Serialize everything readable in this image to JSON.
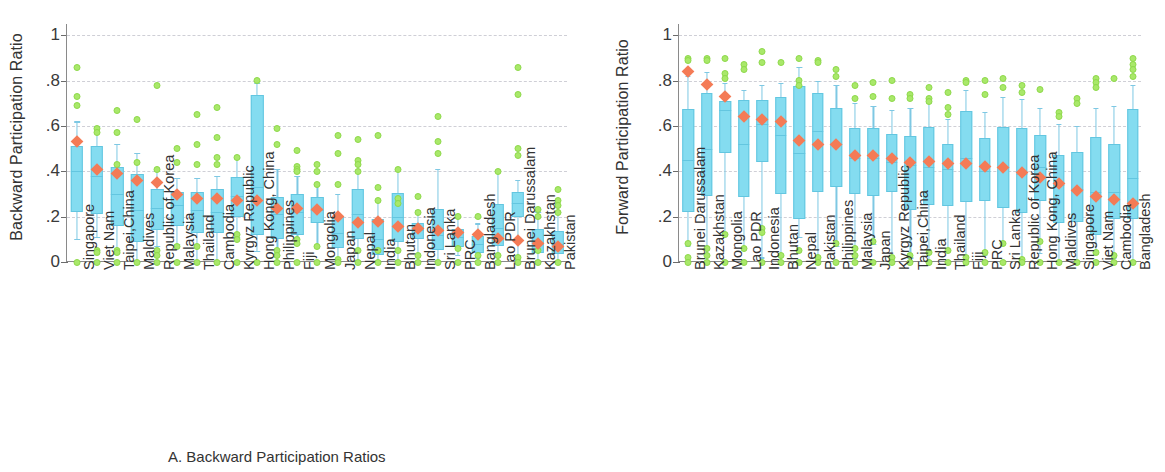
{
  "figure": {
    "panel_a_caption": "A.  Backward Participation Ratios",
    "panel_b_caption": "B.  Forward Participation Ratios"
  },
  "colors": {
    "box_fill": "#84dcf0",
    "box_edge": "#63c6e0",
    "outlier": "#a9e86a",
    "mean_marker": "#f47b56",
    "grid": "#cfcfd6",
    "axis": "#8a8a8a"
  },
  "chart_data": [
    {
      "type": "box",
      "panel": "A",
      "title": "A.  Backward Participation Ratios",
      "xlabel": "",
      "ylabel": "Backward Participation Ratio",
      "ylim": [
        0,
        1.05
      ],
      "yticks": [
        0,
        0.2,
        0.4,
        0.6,
        0.8,
        1
      ],
      "ytick_labels": [
        "0",
        ".2",
        ".4",
        ".6",
        ".8",
        "1"
      ],
      "grid": true,
      "legend": "none",
      "categories": [
        "Singapore",
        "Viet Nam",
        "Taipei,China",
        "Maldives",
        "Republic of Korea",
        "Malaysia",
        "Thailand",
        "Cambodia",
        "Kyrgyz Republic",
        "Hong Kong, China",
        "Philippines",
        "Fiji",
        "Mongolia",
        "Japan",
        "Nepal",
        "India",
        "Bhutan",
        "Indonesia",
        "Sri Lanka",
        "PRC",
        "Bangladesh",
        "Lao PDR",
        "Brunei Darussalam",
        "Kazakhstan",
        "Pakistan"
      ],
      "boxes": [
        {
          "whislo": 0.1,
          "q1": 0.22,
          "med": 0.4,
          "q3": 0.51,
          "whishi": 0.62,
          "mean": 0.53,
          "outliers": [
            0.86,
            0.73,
            0.69,
            0.0
          ]
        },
        {
          "whislo": 0.11,
          "q1": 0.21,
          "med": 0.38,
          "q3": 0.51,
          "whishi": 0.6,
          "mean": 0.41,
          "outliers": [
            0.59,
            0.57,
            0.05,
            0.04,
            0.0
          ]
        },
        {
          "whislo": 0.04,
          "q1": 0.16,
          "med": 0.3,
          "q3": 0.42,
          "whishi": 0.52,
          "mean": 0.39,
          "outliers": [
            0.67,
            0.57,
            0.43,
            0.05,
            0.04,
            0.0
          ]
        },
        {
          "whislo": 0.0,
          "q1": 0.09,
          "med": 0.23,
          "q3": 0.39,
          "whishi": 0.48,
          "mean": 0.36,
          "outliers": [
            0.63,
            0.44,
            0.0
          ]
        },
        {
          "whislo": 0.07,
          "q1": 0.14,
          "med": 0.24,
          "q3": 0.32,
          "whishi": 0.4,
          "mean": 0.35,
          "outliers": [
            0.78,
            0.41,
            0.05,
            0.03,
            0.0
          ]
        },
        {
          "whislo": 0.08,
          "q1": 0.16,
          "med": 0.25,
          "q3": 0.31,
          "whishi": 0.37,
          "mean": 0.3,
          "outliers": [
            0.5,
            0.44,
            0.07,
            0.0
          ]
        },
        {
          "whislo": 0.0,
          "q1": 0.13,
          "med": 0.23,
          "q3": 0.31,
          "whishi": 0.37,
          "mean": 0.28,
          "outliers": [
            0.65,
            0.52,
            0.43,
            0.07,
            0.0
          ]
        },
        {
          "whislo": 0.0,
          "q1": 0.13,
          "med": 0.22,
          "q3": 0.32,
          "whishi": 0.38,
          "mean": 0.28,
          "outliers": [
            0.68,
            0.55,
            0.46,
            0.43,
            0.0
          ]
        },
        {
          "whislo": 0.11,
          "q1": 0.2,
          "med": 0.29,
          "q3": 0.375,
          "whishi": 0.46,
          "mean": 0.27,
          "outliers": [
            0.46,
            0.12,
            0.1,
            0.0
          ]
        },
        {
          "whislo": 0.05,
          "q1": 0.12,
          "med": 0.33,
          "q3": 0.735,
          "whishi": 0.79,
          "mean": 0.27,
          "outliers": [
            0.8,
            0.0
          ]
        },
        {
          "whislo": 0.03,
          "q1": 0.1,
          "med": 0.21,
          "q3": 0.285,
          "whishi": 0.41,
          "mean": 0.235,
          "outliers": [
            0.59,
            0.52,
            0.05,
            0.03,
            0.0
          ]
        },
        {
          "whislo": 0.08,
          "q1": 0.12,
          "med": 0.22,
          "q3": 0.3,
          "whishi": 0.38,
          "mean": 0.235,
          "outliers": [
            0.49,
            0.42,
            0.41,
            0.4,
            0.1,
            0.08,
            0.0
          ]
        },
        {
          "whislo": 0.07,
          "q1": 0.17,
          "med": 0.23,
          "q3": 0.285,
          "whishi": 0.34,
          "mean": 0.23,
          "outliers": [
            0.43,
            0.4,
            0.34,
            0.07,
            0.0
          ]
        },
        {
          "whislo": 0.01,
          "q1": 0.06,
          "med": 0.13,
          "q3": 0.2,
          "whishi": 0.3,
          "mean": 0.2,
          "outliers": [
            0.56,
            0.48,
            0.34,
            0.01,
            0.0
          ]
        },
        {
          "whislo": 0.0,
          "q1": 0.1,
          "med": 0.21,
          "q3": 0.32,
          "whishi": 0.4,
          "mean": 0.175,
          "outliers": [
            0.54,
            0.45,
            0.43,
            0.4,
            0.05,
            0.0
          ]
        },
        {
          "whislo": 0.0,
          "q1": 0.03,
          "med": 0.1,
          "q3": 0.19,
          "whishi": 0.27,
          "mean": 0.18,
          "outliers": [
            0.56,
            0.33,
            0.27,
            0.05,
            0.0
          ]
        },
        {
          "whislo": 0.01,
          "q1": 0.09,
          "med": 0.2,
          "q3": 0.305,
          "whishi": 0.41,
          "mean": 0.155,
          "outliers": [
            0.41,
            0.28,
            0.26,
            0.05,
            0.0
          ]
        },
        {
          "whislo": 0.04,
          "q1": 0.1,
          "med": 0.14,
          "q3": 0.17,
          "whishi": 0.23,
          "mean": 0.15,
          "outliers": [
            0.29,
            0.22,
            0.03,
            0.0
          ]
        },
        {
          "whislo": 0.0,
          "q1": 0.055,
          "med": 0.12,
          "q3": 0.235,
          "whishi": 0.41,
          "mean": 0.14,
          "outliers": [
            0.64,
            0.53,
            0.48,
            0.0
          ]
        },
        {
          "whislo": 0.03,
          "q1": 0.065,
          "med": 0.11,
          "q3": 0.145,
          "whishi": 0.2,
          "mean": 0.13,
          "outliers": [
            0.2,
            0.06,
            0.0
          ]
        },
        {
          "whislo": 0.02,
          "q1": 0.04,
          "med": 0.08,
          "q3": 0.115,
          "whishi": 0.17,
          "mean": 0.12,
          "outliers": [
            0.2,
            0.03,
            0.0
          ]
        },
        {
          "whislo": 0.0,
          "q1": 0.07,
          "med": 0.15,
          "q3": 0.255,
          "whishi": 0.4,
          "mean": 0.105,
          "outliers": [
            0.4,
            0.03,
            0.0
          ]
        },
        {
          "whislo": 0.01,
          "q1": 0.2,
          "med": 0.26,
          "q3": 0.31,
          "whishi": 0.36,
          "mean": 0.095,
          "outliers": [
            0.86,
            0.74,
            0.5,
            0.47,
            0.02,
            0.0
          ]
        },
        {
          "whislo": 0.0,
          "q1": 0.04,
          "med": 0.09,
          "q3": 0.145,
          "whishi": 0.22,
          "mean": 0.08,
          "outliers": [
            0.23,
            0.2,
            0.05,
            0.0
          ]
        },
        {
          "whislo": 0.0,
          "q1": 0.035,
          "med": 0.08,
          "q3": 0.135,
          "whishi": 0.22,
          "mean": 0.07,
          "outliers": [
            0.32,
            0.27,
            0.25,
            0.22,
            0.0
          ]
        }
      ]
    },
    {
      "type": "box",
      "panel": "B",
      "title": "B.  Forward Participation Ratios",
      "xlabel": "",
      "ylabel": "Forward Participation Ratio",
      "ylim": [
        0,
        1.05
      ],
      "yticks": [
        0,
        0.2,
        0.4,
        0.6,
        0.8,
        1
      ],
      "ytick_labels": [
        "0",
        ".2",
        ".4",
        ".6",
        ".8",
        "1"
      ],
      "grid": true,
      "legend": "none",
      "categories": [
        "Brunei Darussalam",
        "Kazakhstan",
        "Mongolia",
        "Lao PDR",
        "Indonesia",
        "Bhutan",
        "Nepal",
        "Pakistan",
        "Philippines",
        "Malaysia",
        "Japan",
        "Kyrgyz Republic",
        "Taipei,China",
        "India",
        "Thailand",
        "Fiji",
        "PRC",
        "Sri Lanka",
        "Republic of Korea",
        "Hong Kong, China",
        "Maldives",
        "Singapore",
        "Viet Nam",
        "Cambodia",
        "Bangladesh"
      ],
      "boxes": [
        {
          "whislo": 0.07,
          "q1": 0.22,
          "med": 0.45,
          "q3": 0.675,
          "whishi": 0.82,
          "mean": 0.84,
          "outliers": [
            0.9,
            0.89,
            0.08,
            0.02,
            0.0
          ]
        },
        {
          "whislo": 0.0,
          "q1": 0.29,
          "med": 0.5,
          "q3": 0.745,
          "whishi": 0.84,
          "mean": 0.785,
          "outliers": [
            0.9,
            0.89,
            0.06,
            0.03,
            0.0
          ]
        },
        {
          "whislo": 0.12,
          "q1": 0.48,
          "med": 0.67,
          "q3": 0.71,
          "whishi": 0.79,
          "mean": 0.73,
          "outliers": [
            0.9,
            0.83,
            0.81,
            0.12,
            0.0
          ]
        },
        {
          "whislo": 0.06,
          "q1": 0.285,
          "med": 0.52,
          "q3": 0.715,
          "whishi": 0.76,
          "mean": 0.64,
          "outliers": [
            0.87,
            0.85,
            0.06,
            0.0
          ]
        },
        {
          "whislo": 0.02,
          "q1": 0.44,
          "med": 0.61,
          "q3": 0.715,
          "whishi": 0.78,
          "mean": 0.63,
          "outliers": [
            0.93,
            0.88,
            0.15,
            0.13,
            0.0
          ]
        },
        {
          "whislo": 0.0,
          "q1": 0.3,
          "med": 0.56,
          "q3": 0.73,
          "whishi": 0.79,
          "mean": 0.62,
          "outliers": [
            0.88,
            0.03,
            0.0
          ]
        },
        {
          "whislo": 0.11,
          "q1": 0.19,
          "med": 0.48,
          "q3": 0.775,
          "whishi": 0.86,
          "mean": 0.535,
          "outliers": [
            0.9,
            0.8,
            0.78,
            0.05,
            0.0
          ]
        },
        {
          "whislo": 0.0,
          "q1": 0.31,
          "med": 0.58,
          "q3": 0.745,
          "whishi": 0.8,
          "mean": 0.52,
          "outliers": [
            0.89,
            0.88,
            0.02,
            0.0
          ]
        },
        {
          "whislo": 0.07,
          "q1": 0.33,
          "med": 0.52,
          "q3": 0.68,
          "whishi": 0.78,
          "mean": 0.52,
          "outliers": [
            0.85,
            0.82,
            0.08,
            0.0
          ]
        },
        {
          "whislo": 0.02,
          "q1": 0.3,
          "med": 0.46,
          "q3": 0.59,
          "whishi": 0.7,
          "mean": 0.47,
          "outliers": [
            0.78,
            0.72,
            0.06,
            0.03,
            0.0
          ]
        },
        {
          "whislo": 0.08,
          "q1": 0.29,
          "med": 0.46,
          "q3": 0.59,
          "whishi": 0.69,
          "mean": 0.47,
          "outliers": [
            0.79,
            0.73,
            0.09,
            0.0
          ]
        },
        {
          "whislo": 0.0,
          "q1": 0.31,
          "med": 0.44,
          "q3": 0.565,
          "whishi": 0.67,
          "mean": 0.455,
          "outliers": [
            0.8,
            0.72,
            0.02,
            0.0
          ]
        },
        {
          "whislo": 0.02,
          "q1": 0.23,
          "med": 0.43,
          "q3": 0.555,
          "whishi": 0.68,
          "mean": 0.44,
          "outliers": [
            0.74,
            0.72,
            0.03,
            0.0
          ]
        },
        {
          "whislo": 0.0,
          "q1": 0.25,
          "med": 0.42,
          "q3": 0.595,
          "whishi": 0.7,
          "mean": 0.445,
          "outliers": [
            0.77,
            0.72,
            0.71,
            0.04,
            0.0
          ]
        },
        {
          "whislo": 0.05,
          "q1": 0.245,
          "med": 0.41,
          "q3": 0.52,
          "whishi": 0.63,
          "mean": 0.435,
          "outliers": [
            0.75,
            0.68,
            0.65,
            0.05,
            0.0
          ]
        },
        {
          "whislo": 0.0,
          "q1": 0.265,
          "med": 0.46,
          "q3": 0.665,
          "whishi": 0.76,
          "mean": 0.435,
          "outliers": [
            0.8,
            0.79,
            0.02,
            0.0
          ]
        },
        {
          "whislo": 0.03,
          "q1": 0.27,
          "med": 0.4,
          "q3": 0.545,
          "whishi": 0.66,
          "mean": 0.42,
          "outliers": [
            0.8,
            0.74,
            0.04,
            0.0
          ]
        },
        {
          "whislo": 0.08,
          "q1": 0.24,
          "med": 0.42,
          "q3": 0.595,
          "whishi": 0.73,
          "mean": 0.415,
          "outliers": [
            0.81,
            0.77,
            0.08,
            0.0
          ]
        },
        {
          "whislo": 0.0,
          "q1": 0.215,
          "med": 0.39,
          "q3": 0.59,
          "whishi": 0.72,
          "mean": 0.395,
          "outliers": [
            0.78,
            0.75,
            0.01,
            0.0
          ]
        },
        {
          "whislo": 0.04,
          "q1": 0.27,
          "med": 0.42,
          "q3": 0.56,
          "whishi": 0.68,
          "mean": 0.375,
          "outliers": [
            0.76,
            0.09,
            0.0
          ]
        },
        {
          "whislo": 0.0,
          "q1": 0.17,
          "med": 0.34,
          "q3": 0.47,
          "whishi": 0.61,
          "mean": 0.345,
          "outliers": [
            0.66,
            0.64,
            0.0
          ]
        },
        {
          "whislo": 0.0,
          "q1": 0.175,
          "med": 0.32,
          "q3": 0.485,
          "whishi": 0.6,
          "mean": 0.315,
          "outliers": [
            0.72,
            0.7,
            0.0
          ]
        },
        {
          "whislo": 0.04,
          "q1": 0.12,
          "med": 0.31,
          "q3": 0.55,
          "whishi": 0.68,
          "mean": 0.29,
          "outliers": [
            0.81,
            0.79,
            0.77,
            0.04,
            0.0
          ]
        },
        {
          "whislo": 0.02,
          "q1": 0.19,
          "med": 0.31,
          "q3": 0.52,
          "whishi": 0.69,
          "mean": 0.275,
          "outliers": [
            0.81,
            0.03,
            0.0
          ]
        },
        {
          "whislo": 0.0,
          "q1": 0.19,
          "med": 0.37,
          "q3": 0.675,
          "whishi": 0.78,
          "mean": 0.26,
          "outliers": [
            0.9,
            0.87,
            0.85,
            0.82,
            0.0
          ]
        }
      ]
    }
  ]
}
